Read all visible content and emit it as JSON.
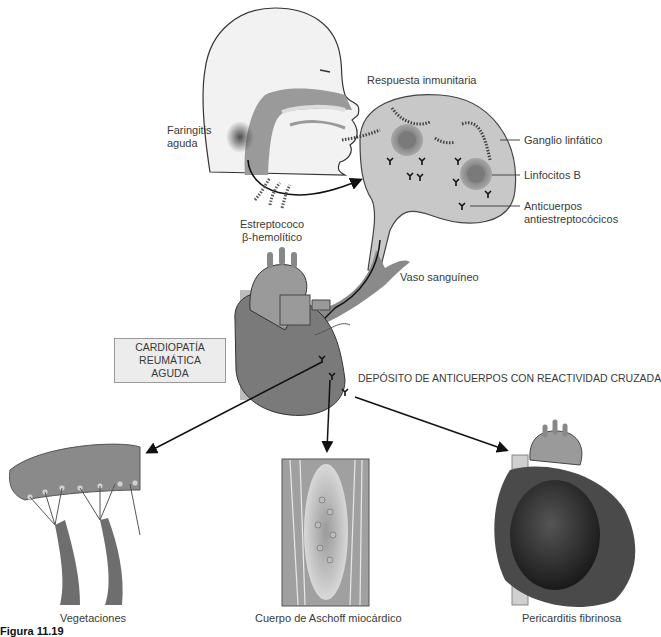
{
  "figure": {
    "caption": "Figura 11.19",
    "colors": {
      "tissue": "#8a8a8a",
      "tissue_dark": "#6e6e6e",
      "skin": "#ececec",
      "node": "#c8c8c8",
      "pericardium": "#2e2e2e",
      "line": "#111111"
    }
  },
  "labels": {
    "faringitis": [
      "Faringitis",
      "aguda"
    ],
    "respuesta": "Respuesta inmunitaria",
    "ganglio": "Ganglio linfático",
    "linfocitos": "Linfocitos B",
    "anticuerpos": [
      "Anticuerpos",
      "antiestreptocócicos"
    ],
    "estreptococo": [
      "Estreptococo",
      "β-hemolítico"
    ],
    "vaso": "Vaso sanguíneo",
    "cardiopatia": [
      "CARDIOPATÍA",
      "REUMÁTICA AGUDA"
    ],
    "deposito": "DEPÓSITO DE ANTICUERPOS CON REACTIVIDAD CRUZADA",
    "vegetaciones": "Vegetaciones",
    "aschoff": "Cuerpo de Aschoff miocárdico",
    "pericarditis": "Pericarditis fibrinosa"
  },
  "icons": {
    "antibody": "Y-shaped antibody glyph",
    "streptococcus": "bead-chain bacteria"
  }
}
